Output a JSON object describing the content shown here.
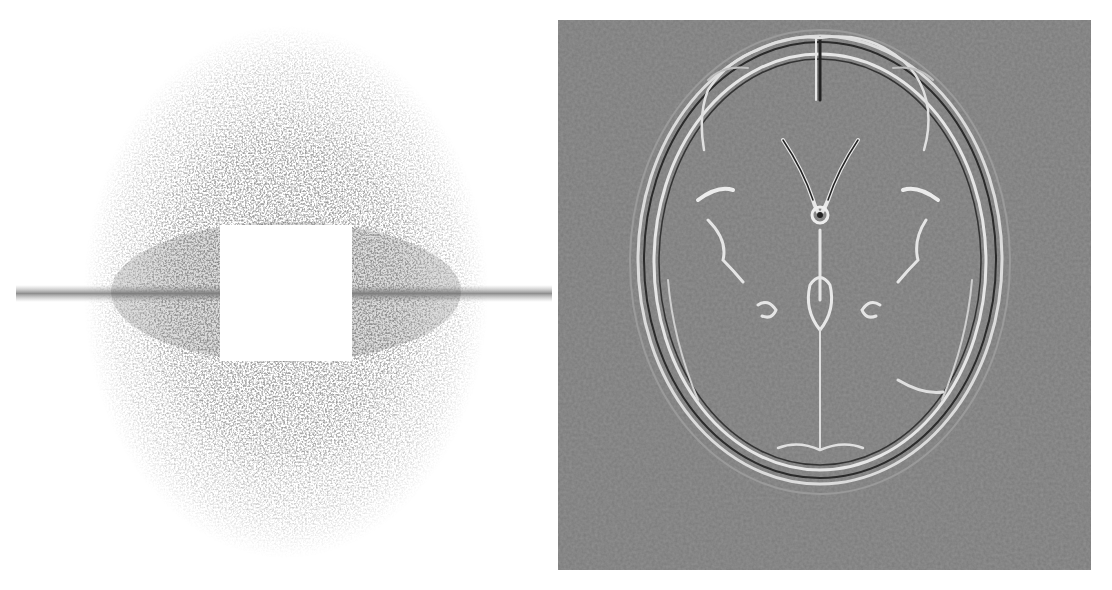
{
  "figure": {
    "panels": [
      {
        "id": "left",
        "description": "k-space sampling pattern: noisy elliptical density with white central square and horizontal line",
        "colors": {
          "background": "#ffffff",
          "noise": "#5a5a5a",
          "center_square": "#ffffff",
          "line": "#9a9a9a"
        },
        "geometry": {
          "center_x": 286,
          "center_y": 292,
          "radius_x": 200,
          "radius_y": 265,
          "square": {
            "x": 220,
            "y": 225,
            "w": 132,
            "h": 136
          },
          "line_y": 294
        }
      },
      {
        "id": "right",
        "description": "edge-enhanced axial brain MRI reconstruction",
        "colors": {
          "background": "#7a7a7a",
          "edge_light": "#e8e8e8",
          "edge_dark": "#2a2a2a"
        },
        "geometry": {
          "x": 558,
          "y": 20,
          "w": 533,
          "h": 550
        }
      }
    ]
  }
}
